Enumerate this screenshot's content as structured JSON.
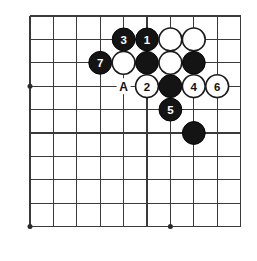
{
  "figure": {
    "board": {
      "columns": 10,
      "rows": 10,
      "origin_x": 30,
      "origin_y": 16,
      "spacing": 23.4,
      "line_color": "#3a3a3a",
      "background_color": "#ffffff"
    },
    "star_points": [
      {
        "col": 0,
        "row": 3
      },
      {
        "col": 0,
        "row": 9
      },
      {
        "col": 6,
        "row": 9
      }
    ],
    "stones": [
      {
        "id": "stone-b-3",
        "color": "black",
        "label": "3",
        "col": 4,
        "row": 1
      },
      {
        "id": "stone-b-1",
        "color": "black",
        "label": "1",
        "col": 5,
        "row": 1
      },
      {
        "id": "stone-w-a",
        "color": "white",
        "label": "",
        "col": 6,
        "row": 1
      },
      {
        "id": "stone-w-b",
        "color": "white",
        "label": "",
        "col": 7,
        "row": 1
      },
      {
        "id": "stone-b-7",
        "color": "black",
        "label": "7",
        "col": 3,
        "row": 2
      },
      {
        "id": "stone-w-c",
        "color": "white",
        "label": "",
        "col": 4,
        "row": 2
      },
      {
        "id": "stone-b-c",
        "color": "black",
        "label": "",
        "col": 5,
        "row": 2
      },
      {
        "id": "stone-w-d",
        "color": "white",
        "label": "",
        "col": 6,
        "row": 2
      },
      {
        "id": "stone-b-d",
        "color": "black",
        "label": "",
        "col": 7,
        "row": 2
      },
      {
        "id": "stone-w-2",
        "color": "white",
        "label": "2",
        "col": 5,
        "row": 3
      },
      {
        "id": "stone-b-e",
        "color": "black",
        "label": "",
        "col": 6,
        "row": 3
      },
      {
        "id": "stone-w-4",
        "color": "white",
        "label": "4",
        "col": 7,
        "row": 3
      },
      {
        "id": "stone-w-6",
        "color": "white",
        "label": "6",
        "col": 8,
        "row": 3
      },
      {
        "id": "stone-b-5",
        "color": "black",
        "label": "5",
        "col": 6,
        "row": 4
      },
      {
        "id": "stone-b-f",
        "color": "black",
        "label": "",
        "col": 7,
        "row": 5
      }
    ],
    "point_markers": [
      {
        "id": "point-a",
        "label": "A",
        "col": 4,
        "row": 3
      }
    ],
    "stone_radius": 11.4,
    "colors": {
      "black_stone": "#141414",
      "white_stone": "#ffffff",
      "stone_outline": "#1b1b1b",
      "black_label": "#ffffff",
      "white_label": "#111111",
      "point_label": "#0d0d0d"
    }
  }
}
